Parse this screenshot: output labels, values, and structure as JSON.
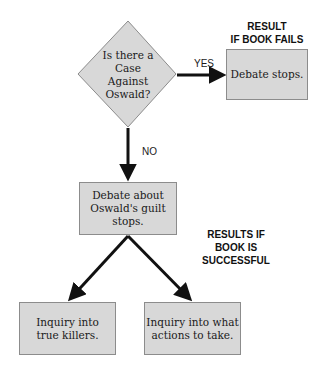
{
  "colors": {
    "node_fill": "#d8d8d8",
    "node_border": "#8c8c8c",
    "arrow": "#111111"
  },
  "decision": {
    "text": "Is there a\nCase\nAgainst\nOswald?"
  },
  "edges": {
    "yes_label": "YES",
    "no_label": "NO"
  },
  "headings": {
    "fail": "RESULT\nIF BOOK FAILS",
    "success": "RESULTS IF\nBOOK IS\nSUCCESSFUL"
  },
  "nodes": {
    "debate_stops": "Debate stops.",
    "guilt_debate_stops": "Debate about\nOswald's guilt stops.",
    "inquiry_killers": "Inquiry into\ntrue killers.",
    "inquiry_actions": "Inquiry into what\nactions to take."
  }
}
